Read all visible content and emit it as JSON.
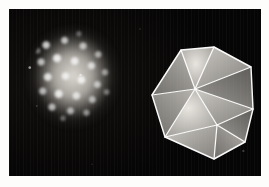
{
  "figure": {
    "caption": "",
    "page_background": "#fdfdfc",
    "plate_background": "#0a0908",
    "plate_margin_px": 9,
    "width_px": 269,
    "height_px": 187
  },
  "panels": [
    {
      "id": "micrograph",
      "position": "left",
      "subject": "virus-capsid-particle",
      "description": "Electron micrograph of an icosahedral virus capsid showing granular capsomere subunits",
      "outline_shape": "rounded-hexagonal",
      "center_px": [
        64,
        69
      ],
      "size_px": [
        94,
        104
      ],
      "highlight_color": "#ffffff",
      "background_color": "#0a0908"
    },
    {
      "id": "model",
      "position": "right",
      "subject": "icosahedron-model",
      "description": "Translucent physical icosahedron model with illuminated white edges",
      "faces_visible": 8,
      "vertices_visible": 7,
      "edge_color": "#ffffff",
      "face_color": "#d8d5cf",
      "center_px": [
        196,
        94
      ],
      "size_px": [
        116,
        132
      ]
    }
  ],
  "geometry": {
    "icosahedron_vertices": {
      "apex_top": [
        67,
        10
      ],
      "upper_left": [
        34,
        13
      ],
      "upper_right": [
        104,
        30
      ],
      "mid_left": [
        5,
        58
      ],
      "mid_center": [
        48,
        52
      ],
      "mid_right": [
        106,
        72
      ],
      "lower_left": [
        18,
        100
      ],
      "lower_center": [
        70,
        88
      ],
      "bottom": [
        67,
        122
      ],
      "lower_right": [
        98,
        105
      ]
    },
    "edges": [
      [
        "upper_left",
        "apex_top"
      ],
      [
        "apex_top",
        "upper_right"
      ],
      [
        "upper_left",
        "mid_left"
      ],
      [
        "upper_left",
        "mid_center"
      ],
      [
        "apex_top",
        "mid_center"
      ],
      [
        "upper_right",
        "mid_center"
      ],
      [
        "upper_right",
        "mid_right"
      ],
      [
        "mid_left",
        "mid_center"
      ],
      [
        "mid_center",
        "mid_right"
      ],
      [
        "mid_left",
        "lower_left"
      ],
      [
        "mid_center",
        "lower_center"
      ],
      [
        "mid_right",
        "lower_right"
      ],
      [
        "mid_left",
        "lower_center"
      ],
      [
        "lower_center",
        "mid_right"
      ],
      [
        "lower_left",
        "lower_center"
      ],
      [
        "lower_center",
        "lower_right"
      ],
      [
        "lower_left",
        "bottom"
      ],
      [
        "lower_center",
        "bottom"
      ],
      [
        "bottom",
        "lower_right"
      ]
    ]
  }
}
